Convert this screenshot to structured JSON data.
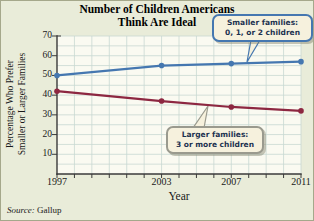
{
  "chart_data": {
    "type": "line",
    "title": "Number of Children Americans Think Are Ideal",
    "title_lines": [
      "Number of Children Americans",
      "Think Are Ideal"
    ],
    "xlabel": "Year",
    "ylabel": "Percentage Who Prefer Smaller or Larger Families",
    "ylabel_lines": [
      "Percentage Who Prefer",
      "Smaller or Larger Families"
    ],
    "x": [
      1997,
      2003,
      2007,
      2011
    ],
    "xlim": [
      1997,
      2011
    ],
    "ylim": [
      0,
      70
    ],
    "xticks": [
      1997,
      2003,
      2007,
      2011
    ],
    "yticks": [
      10,
      20,
      30,
      40,
      50,
      60,
      70
    ],
    "x_minor_step": 1,
    "y_minor_step": 5,
    "grid": true,
    "legend_position": "annotated-callouts",
    "series": [
      {
        "name": "Smaller families: 0, 1, or 2 children",
        "values": [
          50,
          55,
          56,
          57
        ],
        "color": "#4577b0"
      },
      {
        "name": "Larger families: 3 or more children",
        "values": [
          42,
          37,
          34,
          32
        ],
        "color": "#8d2741"
      }
    ]
  },
  "annotations": {
    "smaller": {
      "lines": [
        "Smaller families:",
        "0, 1, or 2 children"
      ],
      "border_color": "#4577b0"
    },
    "larger": {
      "lines": [
        "Larger families:",
        "3 or more children"
      ],
      "border_color": "#9a9a8e"
    }
  },
  "source": {
    "label": "Source:",
    "value": "Gallup"
  },
  "colors": {
    "bg": "#e9ecd9",
    "frame": "#a5a88b",
    "plot_bg": "#fafaf1",
    "grid": "#c8d8d2",
    "axis": "#3a3a3a",
    "callout_bg": "#f6f1dd",
    "callout_text": "#1c3150"
  }
}
